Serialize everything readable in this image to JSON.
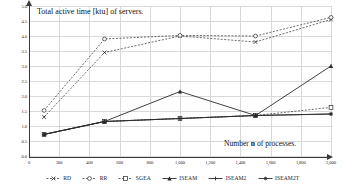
{
  "chart_data": {
    "type": "line",
    "title": "Total active time [ktu] of servers.",
    "xlabel_prefix": "Number ",
    "xlabel_var": "n",
    "xlabel_suffix": " of processes.",
    "ylabel": "",
    "x": [
      100,
      500,
      1000,
      1500,
      2000
    ],
    "xlim": [
      0,
      2000
    ],
    "ylim": [
      0.0,
      5.0
    ],
    "grid": true,
    "legend_position": "bottom",
    "xticks": [
      "0",
      "200",
      "400",
      "600",
      "800",
      "1,000",
      "1,200",
      "1,400",
      "1,600",
      "1,800",
      "2,000"
    ],
    "xtick_values": [
      0,
      200,
      400,
      600,
      800,
      1000,
      1200,
      1400,
      1600,
      1800,
      2000
    ],
    "yticks": [
      "0.0",
      "0.5",
      "1.0",
      "1.5",
      "2.0",
      "2.5",
      "3.0",
      "3.5",
      "4.0",
      "4.5",
      "5.0"
    ],
    "ytick_values": [
      0.0,
      0.5,
      1.0,
      1.5,
      2.0,
      2.5,
      3.0,
      3.5,
      4.0,
      4.5,
      5.0
    ],
    "series": [
      {
        "name": "RD",
        "style": "dashed",
        "marker": "x",
        "values": [
          1.3,
          3.45,
          4.0,
          3.8,
          4.55
        ]
      },
      {
        "name": "RR",
        "style": "dashed",
        "marker": "circle",
        "values": [
          1.52,
          3.9,
          4.02,
          4.0,
          4.62
        ]
      },
      {
        "name": "SGEA",
        "style": "dashed",
        "marker": "square",
        "values": [
          0.72,
          1.15,
          1.25,
          1.35,
          1.62
        ]
      },
      {
        "name": "ISEAM",
        "style": "solid",
        "marker": "triangle",
        "values": [
          0.72,
          1.15,
          2.15,
          1.35,
          3.0
        ]
      },
      {
        "name": "ISEAM2",
        "style": "solid",
        "marker": "plus",
        "values": [
          0.72,
          1.15,
          1.25,
          1.35,
          1.4
        ]
      },
      {
        "name": "ISEAM2T",
        "style": "solid",
        "marker": "star",
        "values": [
          0.72,
          1.15,
          1.25,
          1.35,
          1.4
        ]
      }
    ],
    "colors": {
      "axis": "#3a3a3a",
      "grid": "#d9d9d9",
      "line": "#2b2b2b",
      "background": "#ffffff"
    }
  },
  "legend": {
    "items": [
      {
        "label": "RD"
      },
      {
        "label": "RR"
      },
      {
        "label": "SGEA"
      },
      {
        "label": "ISEAM"
      },
      {
        "label": "ISEAM2"
      },
      {
        "label": "ISEAM2T"
      }
    ]
  }
}
